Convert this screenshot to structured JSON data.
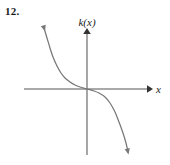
{
  "problem": {
    "number_label": "12."
  },
  "figure": {
    "y_axis_label": "k(x)",
    "x_axis_label": "x",
    "axis_color": "#555555",
    "curve_color": "#777777",
    "background_color": "#ffffff"
  },
  "chart_data": {
    "type": "line",
    "title": "",
    "subtitle": "",
    "xlabel": "x",
    "ylabel": "k(x)",
    "grid": false,
    "legend": null,
    "axes": {
      "origin_px": [
        87,
        89
      ],
      "x_axis_span_px": [
        24,
        150
      ],
      "y_axis_span_px": [
        30,
        155
      ],
      "x_arrow": "right",
      "y_arrow": "up",
      "xlim": [
        -4,
        4
      ],
      "ylim": [
        -4,
        4
      ],
      "ticks": [],
      "tick_labels": []
    },
    "annotations": [
      {
        "text": "12.",
        "position_px": [
          6,
          14
        ],
        "role": "problem-number"
      },
      {
        "text": "k(x)",
        "position_px": [
          87,
          22
        ],
        "role": "y-axis-label"
      },
      {
        "text": "x",
        "position_px": [
          158,
          90
        ],
        "role": "x-axis-label"
      }
    ],
    "series": [
      {
        "name": "k(x)",
        "description": "decreasing cubic-shaped curve with inflection point at the origin, arrowheads at both ends",
        "shape": "negative cubic (y = -x^3 form)",
        "decreasing": true,
        "inflection_point": [
          0,
          0
        ],
        "endpoint_arrows": [
          "upper-left",
          "lower-right"
        ],
        "points_px": [
          [
            44,
            28
          ],
          [
            47,
            38
          ],
          [
            50,
            48
          ],
          [
            53,
            57
          ],
          [
            57,
            66
          ],
          [
            61,
            73
          ],
          [
            65,
            78
          ],
          [
            70,
            82
          ],
          [
            75,
            85
          ],
          [
            80,
            87
          ],
          [
            87,
            89
          ],
          [
            94,
            91
          ],
          [
            99,
            93
          ],
          [
            105,
            97
          ],
          [
            110,
            103
          ],
          [
            115,
            112
          ],
          [
            119,
            122
          ],
          [
            123,
            133
          ],
          [
            126,
            143
          ],
          [
            128,
            152
          ]
        ],
        "x": [
          -2.2,
          -2.0,
          -1.85,
          -1.7,
          -1.5,
          -1.3,
          -1.1,
          -0.85,
          -0.6,
          -0.35,
          0,
          0.35,
          0.6,
          0.85,
          1.1,
          1.3,
          1.5,
          1.7,
          1.85,
          2.0
        ],
        "y": [
          2.8,
          2.4,
          2.05,
          1.75,
          1.45,
          1.15,
          0.85,
          0.55,
          0.3,
          0.1,
          0,
          -0.1,
          -0.3,
          -0.55,
          -0.85,
          -1.15,
          -1.45,
          -1.75,
          -2.05,
          -2.4
        ]
      }
    ]
  }
}
